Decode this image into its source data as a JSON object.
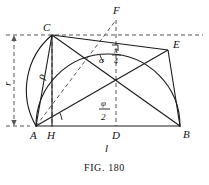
{
  "figure": {
    "caption": "Fig. 180",
    "caption_label": "FIG.",
    "caption_number": "180"
  },
  "points": [
    {
      "id": "A",
      "label": "A",
      "x": 36,
      "y": 126
    },
    {
      "id": "H",
      "label": "H",
      "x": 52,
      "y": 126
    },
    {
      "id": "D",
      "label": "D",
      "x": 116,
      "y": 126
    },
    {
      "id": "B",
      "label": "B",
      "x": 180,
      "y": 126
    },
    {
      "id": "C",
      "label": "C",
      "x": 52,
      "y": 35
    },
    {
      "id": "E",
      "label": "E",
      "x": 168,
      "y": 50
    },
    {
      "id": "F",
      "label": "F",
      "x": 116,
      "y": 20
    }
  ],
  "measures": {
    "radius_label": "r",
    "length_label": "l",
    "rho_label": "ρ",
    "alpha_label": "α",
    "phi_numer": "φ",
    "phi_denom": "2",
    "quarter_pi_numer": "π",
    "quarter_pi_denom": "4"
  },
  "style": {
    "stroke": "#1a1a1a",
    "dash_color": "#555555",
    "background": "#ffffff"
  }
}
